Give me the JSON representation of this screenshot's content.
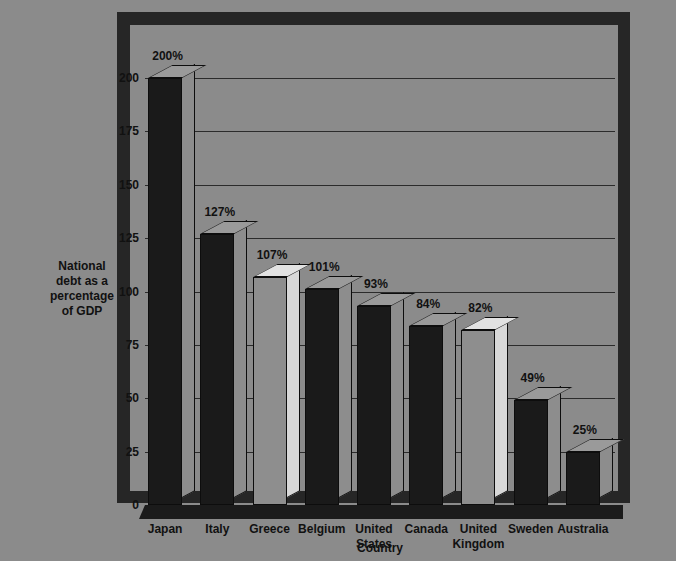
{
  "chart_data": {
    "type": "bar",
    "title": "",
    "subtitle": "",
    "xlabel": "Country",
    "ylabel": "National debt as a percentage of GDP",
    "ylabel_lines": [
      "National",
      "debt as a",
      "percentage",
      "of  GDP"
    ],
    "categories": [
      "Japan",
      "Italy",
      "Greece",
      "Belgium",
      "United States",
      "Canada",
      "United Kingdom",
      "Sweden",
      "Australia"
    ],
    "category_lines": [
      [
        "Japan"
      ],
      [
        "Italy"
      ],
      [
        "Greece"
      ],
      [
        "Belgium"
      ],
      [
        "United",
        "States"
      ],
      [
        "Canada"
      ],
      [
        "United",
        "Kingdom"
      ],
      [
        "Sweden"
      ],
      [
        "Australia"
      ]
    ],
    "values": [
      200,
      127,
      107,
      101,
      93,
      84,
      82,
      49,
      25
    ],
    "value_labels": [
      "200%",
      "127%",
      "107%",
      "101%",
      "93%",
      "84%",
      "82%",
      "49%",
      "25%"
    ],
    "bar_styles": [
      "dark",
      "dark",
      "light",
      "dark",
      "dark",
      "dark",
      "light",
      "dark",
      "dark"
    ],
    "ylim": [
      0,
      200
    ],
    "yticks": [
      0,
      25,
      50,
      75,
      100,
      125,
      150,
      175,
      200
    ],
    "ytick_labels": [
      "0",
      "25",
      "50",
      "75",
      "100",
      "125",
      "150",
      "175",
      "200"
    ],
    "grid": "horizontal",
    "legend": "none",
    "style": "3d-column"
  },
  "colors": {
    "background": "#8b8b8b",
    "frame": "#262626",
    "gridline": "#2b2b2b",
    "bar_dark_front": "#1a1a1a",
    "bar_dark_side": "#8d8d8d",
    "bar_dark_top": "#9a9a9a",
    "bar_light_front": "#8e8e8e",
    "bar_light_side": "#d8d8d8",
    "bar_light_top": "#e2e2e2",
    "text": "#111111",
    "floor": "#1b1b1b"
  }
}
